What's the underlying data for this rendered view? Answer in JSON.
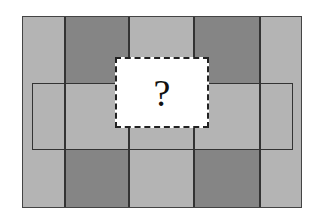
{
  "diagram": {
    "colors": {
      "light": "#b4b4b4",
      "dark": "#858585",
      "line": "#333333",
      "missing": "#ffffff"
    },
    "columns": [
      22,
      65,
      129,
      194,
      260,
      302
    ],
    "rows": [
      16,
      83,
      150,
      208
    ],
    "pattern": {
      "top_row": [
        "light",
        "dark",
        "light",
        "dark",
        "light"
      ],
      "middle_row": [
        "light",
        "light",
        "light",
        "light",
        "light"
      ],
      "bottom_row": [
        "light",
        "dark",
        "light",
        "dark",
        "light"
      ]
    },
    "missing_piece": {
      "label": "?"
    }
  }
}
